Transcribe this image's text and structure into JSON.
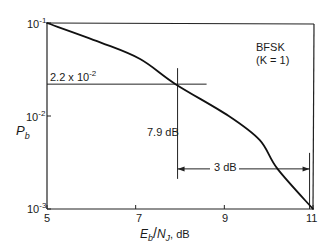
{
  "chart_data": {
    "type": "line",
    "title": "",
    "xlabel": "E_b/N_J, dB",
    "ylabel": "P_b",
    "xscale": "linear",
    "yscale": "log",
    "xlim": [
      5,
      11
    ],
    "ylim": [
      0.001,
      0.1
    ],
    "xticks": [
      5,
      7,
      9,
      11
    ],
    "xtick_labels": [
      "5",
      "7",
      "9",
      "11"
    ],
    "yticks": [
      0.1,
      0.01,
      0.001
    ],
    "ytick_labels": [
      "10^-1",
      "10^-2",
      "10^-3"
    ],
    "grid": false,
    "legend": null,
    "series": [
      {
        "name": "BFSK (K = 1)",
        "x": [
          5.0,
          6.2,
          7.1,
          7.9,
          9.1,
          9.8,
          10.2,
          11.0
        ],
        "y": [
          0.1,
          0.062,
          0.041,
          0.022,
          0.01,
          0.0055,
          0.0027,
          0.001
        ]
      }
    ],
    "annotations": [
      {
        "text": "BFSK",
        "type": "label"
      },
      {
        "text": "(K = 1)",
        "type": "label"
      },
      {
        "text": "2.2 x 10^-2",
        "type": "horizontal-reference",
        "y": 0.022,
        "x_from": 5,
        "x_to": 8.6
      },
      {
        "text": "7.9 dB",
        "type": "vertical-reference",
        "x": 7.9
      },
      {
        "text": "3 dB",
        "type": "dimension-arrow",
        "x_from": 7.9,
        "x_to": 10.9,
        "y": 0.0027
      }
    ]
  },
  "labels": {
    "y_tick_1_base": "10",
    "y_tick_1_exp": "-1",
    "y_tick_2_base": "10",
    "y_tick_2_exp": "-2",
    "y_tick_3_base": "10",
    "y_tick_3_exp": "-3",
    "x_tick_5": "5",
    "x_tick_7": "7",
    "x_tick_9": "9",
    "x_tick_11": "11",
    "ylabel_main": "P",
    "ylabel_sub": "b",
    "xlabel_e": "E",
    "xlabel_e_sub": "b",
    "xlabel_slash": "/",
    "xlabel_n": "N",
    "xlabel_n_sub": "J",
    "xlabel_unit": ", dB",
    "legend_line1": "BFSK",
    "legend_line2": "(K = 1)",
    "ref_p_base": "2.2 x 10",
    "ref_p_exp": "-2",
    "ref_db": "7.9 dB",
    "delta_db": "3 dB"
  }
}
